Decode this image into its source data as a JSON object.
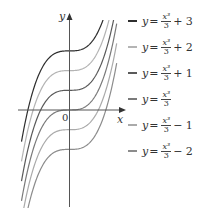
{
  "chart_data": {
    "type": "line",
    "title": "",
    "xlabel": "x",
    "ylabel": "y",
    "origin_label": "0",
    "x_range": [
      -2.1,
      2.0
    ],
    "y_range": [
      -5,
      4.4
    ],
    "grid": false,
    "legend_position": "right",
    "x_samples": [
      -2.0,
      -1.5,
      -1.0,
      -0.5,
      0,
      0.5,
      1.0,
      1.5,
      2.0
    ],
    "series": [
      {
        "name": "y = x^3/3 + 3",
        "label_num": "x³",
        "label_den": "3",
        "label_rest": "+ 3",
        "offset": 3,
        "color": "#2e2e2e",
        "values": [
          0.33,
          1.88,
          2.67,
          2.96,
          3,
          3.04,
          3.33,
          4.13,
          5.67
        ]
      },
      {
        "name": "y = x^3/3 + 2",
        "label_num": "x³",
        "label_den": "3",
        "label_rest": "+ 2",
        "offset": 2,
        "color": "#b4b4b4",
        "values": [
          -0.67,
          0.88,
          1.67,
          1.96,
          2,
          2.04,
          2.33,
          3.13,
          4.67
        ]
      },
      {
        "name": "y = x^3/3 + 1",
        "label_num": "x³",
        "label_den": "3",
        "label_rest": "+ 1",
        "offset": 1,
        "color": "#5a5a5a",
        "values": [
          -1.67,
          -0.13,
          0.67,
          0.96,
          1,
          1.04,
          1.33,
          2.13,
          3.67
        ]
      },
      {
        "name": "y = x^3/3",
        "label_num": "x³",
        "label_den": "3",
        "label_rest": "",
        "offset": 0,
        "color": "#7a7a7a",
        "values": [
          -2.67,
          -1.13,
          -0.33,
          -0.04,
          0,
          0.04,
          0.33,
          1.13,
          2.67
        ]
      },
      {
        "name": "y = x^3/3 - 1",
        "label_num": "x³",
        "label_den": "3",
        "label_rest": "− 1",
        "offset": -1,
        "color": "#aaaaaa",
        "values": [
          -3.67,
          -2.13,
          -1.33,
          -1.04,
          -1,
          -0.96,
          -0.67,
          0.13,
          1.67
        ]
      },
      {
        "name": "y = x^3/3 - 2",
        "label_num": "x³",
        "label_den": "3",
        "label_rest": "− 2",
        "offset": -2,
        "color": "#8c8c8c",
        "values": [
          -4.67,
          -3.13,
          -2.33,
          -2.04,
          -2,
          -1.96,
          -1.67,
          -0.88,
          0.67
        ]
      }
    ]
  },
  "legend": {
    "items": [
      {
        "prefix": "y",
        "eq": "=",
        "num": "x³",
        "den": "3",
        "rest": "+ 3"
      },
      {
        "prefix": "y",
        "eq": "=",
        "num": "x³",
        "den": "3",
        "rest": "+ 2"
      },
      {
        "prefix": "y",
        "eq": "=",
        "num": "x³",
        "den": "3",
        "rest": "+ 1"
      },
      {
        "prefix": "y",
        "eq": "=",
        "num": "x³",
        "den": "3",
        "rest": ""
      },
      {
        "prefix": "y",
        "eq": "=",
        "num": "x³",
        "den": "3",
        "rest": "− 1"
      },
      {
        "prefix": "y",
        "eq": "=",
        "num": "x³",
        "den": "3",
        "rest": "− 2"
      }
    ]
  },
  "axes": {
    "x_label": "x",
    "y_label": "y",
    "origin": "0"
  }
}
